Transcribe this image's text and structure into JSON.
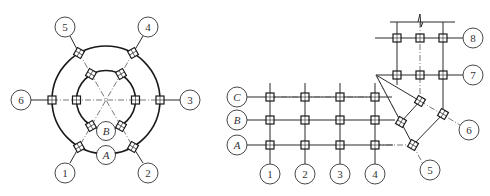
{
  "figure": "Two structural axis-grid layouts with column markers",
  "left_diagram": {
    "type": "circular-plan",
    "radial_axes": [
      "1",
      "2",
      "3",
      "4",
      "5",
      "6"
    ],
    "ring_axes": [
      "A",
      "B"
    ],
    "labels": {
      "axis_1": "1",
      "axis_2": "2",
      "axis_3": "3",
      "axis_4": "4",
      "axis_5": "5",
      "axis_6": "6",
      "ring_A": "A",
      "ring_B": "B"
    }
  },
  "right_diagram": {
    "type": "L-shaped-grid-with-rotated-wing",
    "row_axes": [
      "A",
      "B",
      "C"
    ],
    "column_axes": [
      "1",
      "2",
      "3",
      "4"
    ],
    "rotated_axes": [
      "5",
      "6"
    ],
    "upper_rows": [
      "7",
      "8"
    ],
    "labels": {
      "row_A": "A",
      "row_B": "B",
      "row_C": "C",
      "col_1": "1",
      "col_2": "2",
      "col_3": "3",
      "col_4": "4",
      "axis_5": "5",
      "axis_6": "6",
      "axis_7": "7",
      "axis_8": "8"
    },
    "break_mark": "zigzag break line at top"
  }
}
